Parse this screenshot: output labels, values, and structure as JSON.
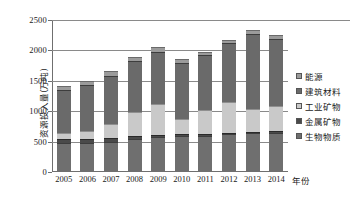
{
  "chart_data": {
    "type": "bar",
    "stacked": true,
    "title": "",
    "xlabel": "年份",
    "ylabel": "资源投入量(万吨)",
    "categories": [
      "2005",
      "2006",
      "2007",
      "2008",
      "2009",
      "2010",
      "2011",
      "2012",
      "2013",
      "2014"
    ],
    "ylim": [
      0,
      2500
    ],
    "yticks": [
      0,
      500,
      1000,
      1500,
      2000,
      2500
    ],
    "grid": true,
    "legend_position": "right",
    "series": [
      {
        "name": "生物物质",
        "values": [
          480,
          485,
          500,
          550,
          575,
          600,
          600,
          620,
          635,
          645
        ]
      },
      {
        "name": "金属矿物",
        "values": [
          55,
          60,
          60,
          45,
          30,
          20,
          25,
          25,
          20,
          25
        ]
      },
      {
        "name": "工业矿物",
        "values": [
          110,
          130,
          230,
          400,
          510,
          250,
          400,
          510,
          385,
          420
        ]
      },
      {
        "name": "建筑材料",
        "values": [
          700,
          760,
          790,
          830,
          860,
          930,
          900,
          975,
          1225,
          1105
        ]
      },
      {
        "name": "能源",
        "values": [
          65,
          60,
          90,
          60,
          85,
          60,
          50,
          50,
          65,
          55
        ]
      }
    ],
    "totals": [
      1410,
      1495,
      1670,
      1885,
      2060,
      1860,
      1975,
      2180,
      2330,
      2250
    ]
  },
  "legend": {
    "items": [
      {
        "label": "能源",
        "series_index": 4,
        "color": "#9b9b9b"
      },
      {
        "label": "建筑材料",
        "series_index": 3,
        "color": "#6a6a6a"
      },
      {
        "label": "工业矿物",
        "series_index": 2,
        "color": "#c9c9c9"
      },
      {
        "label": "金属矿物",
        "series_index": 1,
        "color": "#4a4a4a"
      },
      {
        "label": "生物物质",
        "series_index": 0,
        "color": "#6f6f6f"
      }
    ]
  }
}
